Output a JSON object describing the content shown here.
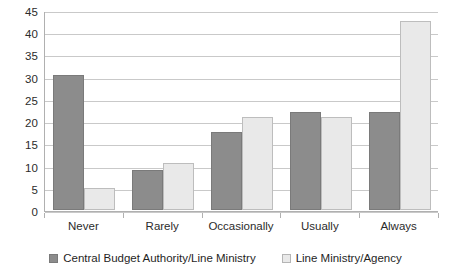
{
  "chart_data": {
    "type": "bar",
    "title": "",
    "subtitle": "",
    "xlabel": "",
    "ylabel": "",
    "categories": [
      "Never",
      "Rarely",
      "Occasionally",
      "Usually",
      "Always"
    ],
    "series": [
      {
        "name": "Central Budget Authority/Line Ministry",
        "color": "#8c8c8c",
        "values": [
          30.3,
          9.0,
          17.5,
          22.0,
          22.0
        ]
      },
      {
        "name": "Line Ministry/Agency",
        "color": "#e9e9e9",
        "values": [
          5.0,
          10.5,
          21.0,
          21.0,
          42.5
        ]
      }
    ],
    "ylim": [
      0,
      45
    ],
    "ytick_labels": [
      "0",
      "5",
      "10",
      "15",
      "20",
      "25",
      "30",
      "35",
      "40",
      "45"
    ],
    "ytick_values": [
      0,
      5,
      10,
      15,
      20,
      25,
      30,
      35,
      40,
      45
    ],
    "grid": true,
    "grid_axis": "y",
    "legend_position": "bottom"
  }
}
